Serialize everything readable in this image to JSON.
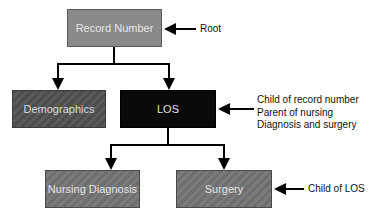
{
  "diagram": {
    "type": "hierarchy",
    "nodes": {
      "root": "Record Number",
      "demographics": "Demographics",
      "los": "LOS",
      "nursing": "Nursing Diagnosis",
      "surgery": "Surgery"
    },
    "edges": [
      [
        "Record Number",
        "Demographics"
      ],
      [
        "Record Number",
        "LOS"
      ],
      [
        "LOS",
        "Nursing Diagnosis"
      ],
      [
        "LOS",
        "Surgery"
      ]
    ],
    "annotations": {
      "root": "Root",
      "los_line1": "Child of record number",
      "los_line2": "Parent of nursing",
      "los_line3": "Diagnosis and surgery",
      "surgery": "Child of LOS"
    },
    "colors": {
      "root_fill": "#8a8a8a",
      "los_fill": "#0a0a0a",
      "child_fill": "#757575",
      "line": "#000000"
    }
  }
}
